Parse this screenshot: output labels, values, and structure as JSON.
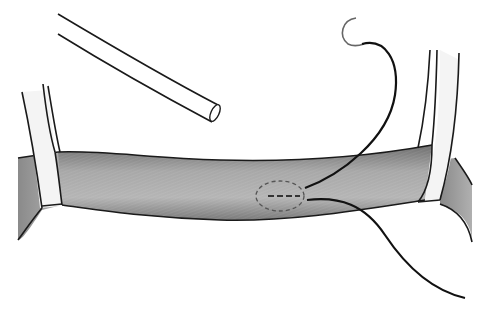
{
  "illustration": {
    "subject": "vessel-with-loops-and-suture",
    "colors": {
      "background": "#ffffff",
      "outline": "#1a1a1a",
      "vessel_fill": "#9a9a9a",
      "vessel_dark": "#707070",
      "loop_fill": "#f2f2f2",
      "incision": "#555555"
    },
    "elements": [
      "catheter-tube",
      "left-vessel-loop",
      "right-vessel-loop",
      "blood-vessel",
      "incision-ellipse",
      "suture-needle",
      "suture-thread"
    ]
  }
}
